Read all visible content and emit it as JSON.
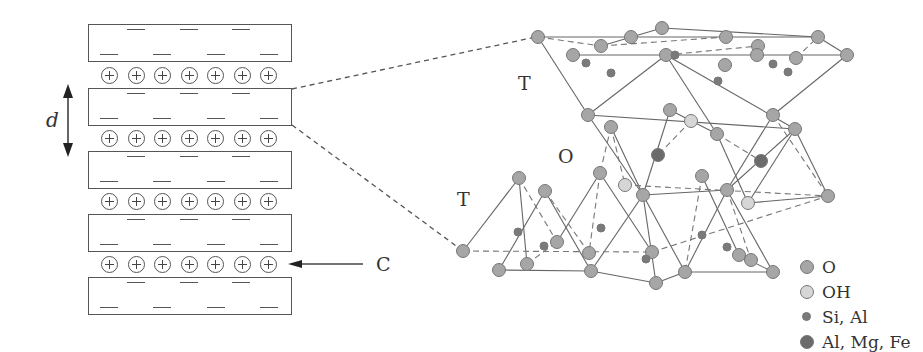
{
  "diagram": {
    "left_panel": {
      "spacing_label": "d",
      "cation_label": "C",
      "layer_count": 5,
      "cation_rows": 4,
      "cations_per_row": 7,
      "ion_symbol": "+",
      "charge_symbol": "−"
    },
    "right_panel": {
      "sheet_labels": [
        {
          "id": "top-tetrahedral",
          "text": "T"
        },
        {
          "id": "octahedral",
          "text": "O"
        },
        {
          "id": "bottom-tetrahedral",
          "text": "T"
        }
      ]
    },
    "legend": [
      {
        "label": "O",
        "color": "#a6a6a6",
        "size": 14
      },
      {
        "label": "OH",
        "color": "#d6d6d6",
        "size": 14
      },
      {
        "label": "Si, Al",
        "color": "#7a7a7a",
        "size": 9
      },
      {
        "label": "Al, Mg, Fe",
        "color": "#6b6b6b",
        "size": 14
      }
    ]
  }
}
